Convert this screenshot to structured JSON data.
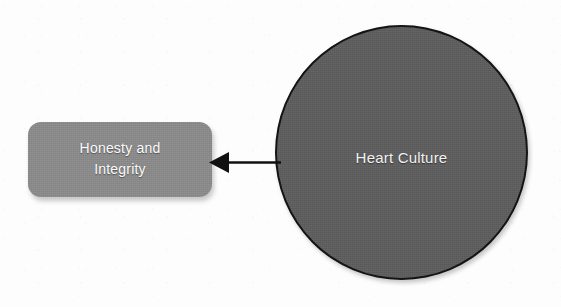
{
  "diagram": {
    "type": "flow-diagram",
    "background_color": "#fdfdfd",
    "nodes": [
      {
        "id": "heart-culture",
        "shape": "circle",
        "label": "Heart Culture",
        "fill_color": "#5d5d5d",
        "border_color": "#141414",
        "text_color": "#f2f2f2"
      },
      {
        "id": "honesty-and-integrity",
        "shape": "rounded-rectangle",
        "label_line1": "Honesty and",
        "label_line2": "Integrity",
        "fill_color": "#8b8b8b",
        "text_color": "#fbfbfb"
      }
    ],
    "edges": [
      {
        "id": "heart-culture-to-honesty",
        "from": "heart-culture",
        "to": "honesty-and-integrity",
        "direction": "left",
        "arrowhead": "solid-triangle",
        "color": "#111111"
      }
    ]
  }
}
